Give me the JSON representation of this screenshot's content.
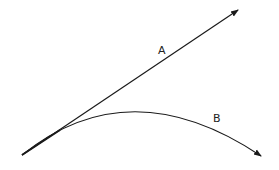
{
  "diagram": {
    "type": "vector-comparison",
    "colors": {
      "stroke": "#1a1a1a",
      "background": "#ffffff"
    },
    "origin": {
      "x": 22,
      "y": 155
    },
    "paths": [
      {
        "id": "A",
        "label": "A",
        "kind": "straight-arrow",
        "start": [
          22,
          155
        ],
        "end": [
          239,
          9
        ],
        "label_pos": [
          162,
          54
        ]
      },
      {
        "id": "B",
        "label": "B",
        "kind": "curved-arrow",
        "start": [
          22,
          155
        ],
        "control": [
          130,
          70
        ],
        "end": [
          262,
          157
        ],
        "label_pos": [
          216,
          122
        ]
      }
    ]
  }
}
